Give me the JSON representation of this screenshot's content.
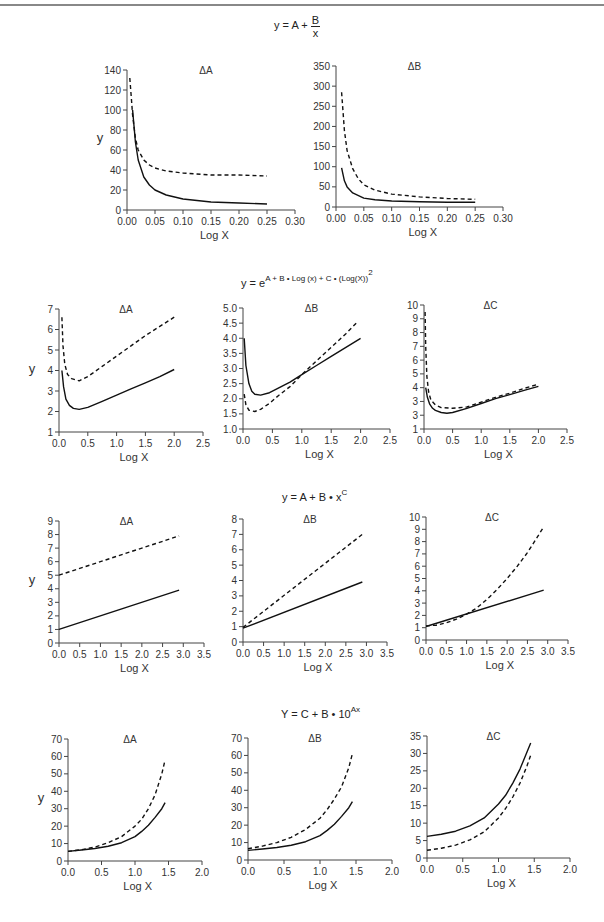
{
  "page": {
    "header_text": ""
  },
  "sections": [
    {
      "formula_text": "y = A + B/x",
      "formula_main": "y = A + ",
      "formula_num": "B",
      "formula_den": "x"
    },
    {
      "formula_text": "y = e^(A + B·Log (x) + C·(Log(X))^2)",
      "formula_main": "y = e",
      "formula_sup": "A + B • Log (x) + C • (Log(X))",
      "formula_sup2": "2"
    },
    {
      "formula_text": "y = A + B · x^C",
      "formula_main": "y = A + B • x",
      "formula_sup": "C"
    },
    {
      "formula_text": "Y = C + B · 10^Ax",
      "formula_main": "Y = C + B • 10",
      "formula_sup": "Ax"
    }
  ],
  "chart_data": [
    {
      "type": "line",
      "section": 0,
      "title": "ΔA",
      "xlabel": "Log X",
      "ylabel": "y",
      "xlim": [
        0,
        0.3
      ],
      "ylim": [
        0,
        140
      ],
      "xticks": [
        "0.00",
        "0.05",
        "0.10",
        "0.15",
        "0.20",
        "0.25",
        "0.30"
      ],
      "yticks": [
        "0",
        "20",
        "40",
        "60",
        "80",
        "100",
        "120",
        "140"
      ],
      "box": {
        "x0": 127,
        "x1": 295,
        "ytop": 70,
        "ybot": 210
      },
      "series": [
        {
          "name": "solid",
          "style": "solid",
          "x": [
            0.01,
            0.015,
            0.02,
            0.03,
            0.04,
            0.05,
            0.07,
            0.1,
            0.15,
            0.2,
            0.25
          ],
          "y": [
            100,
            68,
            50,
            33,
            25,
            20,
            15,
            11,
            8,
            7,
            6
          ]
        },
        {
          "name": "dashed",
          "style": "dashed",
          "x": [
            0.005,
            0.008,
            0.01,
            0.015,
            0.02,
            0.03,
            0.04,
            0.05,
            0.07,
            0.1,
            0.15,
            0.2,
            0.25
          ],
          "y": [
            132,
            110,
            95,
            72,
            60,
            50,
            45,
            42,
            39,
            37,
            35,
            35,
            34
          ]
        }
      ]
    },
    {
      "type": "line",
      "section": 0,
      "title": "ΔB",
      "xlabel": "Log X",
      "ylabel": "",
      "xlim": [
        0,
        0.3
      ],
      "ylim": [
        0,
        350
      ],
      "xticks": [
        "0.00",
        "0.05",
        "0.10",
        "0.15",
        "0.20",
        "0.25",
        "0.30"
      ],
      "yticks": [
        "0",
        "50",
        "100",
        "150",
        "200",
        "250",
        "300",
        "350"
      ],
      "box": {
        "x0": 336,
        "x1": 503,
        "ytop": 66,
        "ybot": 207
      },
      "series": [
        {
          "name": "solid",
          "style": "solid",
          "x": [
            0.01,
            0.015,
            0.02,
            0.03,
            0.05,
            0.07,
            0.1,
            0.15,
            0.2,
            0.25
          ],
          "y": [
            97,
            65,
            50,
            35,
            22,
            18,
            15,
            13,
            12,
            12
          ]
        },
        {
          "name": "dashed",
          "style": "dashed",
          "x": [
            0.01,
            0.015,
            0.02,
            0.03,
            0.04,
            0.05,
            0.07,
            0.1,
            0.15,
            0.2,
            0.25
          ],
          "y": [
            285,
            190,
            140,
            95,
            70,
            55,
            42,
            32,
            25,
            21,
            19
          ]
        }
      ]
    },
    {
      "type": "line",
      "section": 1,
      "title": "ΔA",
      "xlabel": "Log X",
      "ylabel": "y",
      "xlim": [
        0,
        2.5
      ],
      "ylim": [
        1,
        7
      ],
      "xticks": [
        "0.0",
        "0.5",
        "1.0",
        "1.5",
        "2.0",
        "2.5"
      ],
      "yticks": [
        "1",
        "2",
        "3",
        "4",
        "5",
        "6",
        "7"
      ],
      "box": {
        "x0": 59,
        "x1": 203,
        "ytop": 309,
        "ybot": 432
      },
      "series": [
        {
          "name": "solid",
          "style": "solid",
          "x": [
            0.05,
            0.08,
            0.12,
            0.18,
            0.25,
            0.35,
            0.5,
            0.75,
            1.0,
            1.25,
            1.5,
            1.75,
            2.0
          ],
          "y": [
            4.0,
            3.2,
            2.6,
            2.3,
            2.15,
            2.1,
            2.2,
            2.5,
            2.8,
            3.1,
            3.4,
            3.7,
            4.05
          ]
        },
        {
          "name": "dashed",
          "style": "dashed",
          "x": [
            0.05,
            0.07,
            0.1,
            0.15,
            0.22,
            0.35,
            0.5,
            0.75,
            1.0,
            1.25,
            1.5,
            1.75,
            2.0
          ],
          "y": [
            6.6,
            5.2,
            4.3,
            3.8,
            3.6,
            3.5,
            3.7,
            4.2,
            4.7,
            5.2,
            5.7,
            6.15,
            6.6
          ]
        }
      ]
    },
    {
      "type": "line",
      "section": 1,
      "title": "ΔB",
      "xlabel": "Log X",
      "ylabel": "",
      "xlim": [
        0,
        2.5
      ],
      "ylim": [
        1.0,
        5.0
      ],
      "xticks": [
        "0.0",
        "0.5",
        "1.0",
        "1.5",
        "2.0",
        "2.5"
      ],
      "yticks": [
        "1.0",
        "1.5",
        "2.0",
        "2.5",
        "3.0",
        "3.5",
        "4.0",
        "4.5",
        "5.0"
      ],
      "box": {
        "x0": 243,
        "x1": 390,
        "ytop": 308,
        "ybot": 429
      },
      "series": [
        {
          "name": "solid",
          "style": "solid",
          "x": [
            0.02,
            0.05,
            0.1,
            0.15,
            0.2,
            0.3,
            0.45,
            0.6,
            0.8,
            1.0,
            1.25,
            1.5,
            1.75,
            2.0
          ],
          "y": [
            4.0,
            3.1,
            2.5,
            2.25,
            2.15,
            2.12,
            2.2,
            2.35,
            2.55,
            2.8,
            3.1,
            3.4,
            3.7,
            4.0
          ]
        },
        {
          "name": "dashed",
          "style": "dashed",
          "x": [
            0.02,
            0.05,
            0.1,
            0.2,
            0.3,
            0.45,
            0.6,
            0.8,
            1.0,
            1.25,
            1.5,
            1.75,
            1.95
          ],
          "y": [
            2.15,
            1.8,
            1.62,
            1.58,
            1.65,
            1.85,
            2.1,
            2.4,
            2.8,
            3.25,
            3.7,
            4.15,
            4.55
          ]
        }
      ]
    },
    {
      "type": "line",
      "section": 1,
      "title": "ΔC",
      "xlabel": "Log X",
      "ylabel": "",
      "xlim": [
        0,
        2.5
      ],
      "ylim": [
        1,
        10
      ],
      "xticks": [
        "0.0",
        "0.5",
        "1.0",
        "1.5",
        "2.0",
        "2.5"
      ],
      "yticks": [
        "1",
        "3",
        "3",
        "4",
        "5",
        "6",
        "7",
        "8",
        "9",
        "10"
      ],
      "box": {
        "x0": 424,
        "x1": 567,
        "ytop": 305,
        "ybot": 429
      },
      "series": [
        {
          "name": "solid",
          "style": "solid",
          "x": [
            0.03,
            0.06,
            0.1,
            0.15,
            0.2,
            0.3,
            0.4,
            0.5,
            0.75,
            1.0,
            1.25,
            1.5,
            1.75,
            2.0
          ],
          "y": [
            4.0,
            3.3,
            2.8,
            2.5,
            2.35,
            2.2,
            2.15,
            2.2,
            2.5,
            2.85,
            3.2,
            3.5,
            3.8,
            4.1
          ]
        },
        {
          "name": "dashed",
          "style": "dashed",
          "x": [
            0.02,
            0.03,
            0.05,
            0.08,
            0.12,
            0.2,
            0.3,
            0.5,
            0.75,
            1.0,
            1.25,
            1.5,
            1.75,
            2.0
          ],
          "y": [
            9.5,
            7.0,
            4.8,
            3.7,
            3.1,
            2.75,
            2.55,
            2.5,
            2.6,
            2.95,
            3.3,
            3.6,
            3.95,
            4.25
          ]
        }
      ]
    },
    {
      "type": "line",
      "section": 2,
      "title": "ΔA",
      "xlabel": "Log X",
      "ylabel": "y",
      "xlim": [
        0,
        3.5
      ],
      "ylim": [
        0,
        9
      ],
      "xticks": [
        "0.0",
        "0.5",
        "1.0",
        "1.5",
        "2.0",
        "2.5",
        "3.0",
        "3.5"
      ],
      "yticks": [
        "0",
        "1",
        "2",
        "3",
        "4",
        "5",
        "6",
        "7",
        "8",
        "9"
      ],
      "box": {
        "x0": 59,
        "x1": 204,
        "ytop": 521,
        "ybot": 643
      },
      "series": [
        {
          "name": "solid",
          "style": "solid",
          "x": [
            0.0,
            2.9
          ],
          "y": [
            1.0,
            3.9
          ]
        },
        {
          "name": "dashed",
          "style": "dashed",
          "x": [
            0.0,
            2.9
          ],
          "y": [
            5.0,
            7.9
          ]
        }
      ]
    },
    {
      "type": "line",
      "section": 2,
      "title": "ΔB",
      "xlabel": "Log X",
      "ylabel": "",
      "xlim": [
        0,
        3.5
      ],
      "ylim": [
        0,
        8
      ],
      "xticks": [
        "0.0",
        "0.5",
        "1.0",
        "1.5",
        "2.0",
        "2.5",
        "3.0",
        "3.5"
      ],
      "yticks": [
        "0",
        "1",
        "2",
        "3",
        "4",
        "5",
        "6",
        "7",
        "8"
      ],
      "box": {
        "x0": 243,
        "x1": 387,
        "ytop": 519,
        "ybot": 642
      },
      "series": [
        {
          "name": "solid",
          "style": "solid",
          "x": [
            0.0,
            2.9
          ],
          "y": [
            0.9,
            3.9
          ]
        },
        {
          "name": "dashed",
          "style": "dashed",
          "x": [
            0.0,
            2.9
          ],
          "y": [
            0.95,
            7.0
          ]
        }
      ]
    },
    {
      "type": "line",
      "section": 2,
      "title": "ΔC",
      "xlabel": "Log X",
      "ylabel": "",
      "xlim": [
        0,
        3.5
      ],
      "ylim": [
        0,
        10
      ],
      "xticks": [
        "0.0",
        "0.5",
        "1.0",
        "1.5",
        "2.0",
        "2.5",
        "3.0",
        "3.5"
      ],
      "yticks": [
        "0",
        "1",
        "2",
        "3",
        "4",
        "5",
        "6",
        "7",
        "8",
        "9",
        "10"
      ],
      "box": {
        "x0": 426,
        "x1": 568,
        "ytop": 517,
        "ybot": 640
      },
      "series": [
        {
          "name": "solid",
          "style": "solid",
          "x": [
            0.0,
            2.9
          ],
          "y": [
            1.1,
            4.05
          ]
        },
        {
          "name": "dashed",
          "style": "dashed",
          "x": [
            0.0,
            0.25,
            0.5,
            0.75,
            1.0,
            1.25,
            1.5,
            1.75,
            2.0,
            2.25,
            2.5,
            2.75,
            2.9
          ],
          "y": [
            1.15,
            1.2,
            1.4,
            1.7,
            2.1,
            2.6,
            3.3,
            4.1,
            5.0,
            6.0,
            7.1,
            8.4,
            9.2
          ]
        }
      ]
    },
    {
      "type": "line",
      "section": 3,
      "title": "ΔA",
      "xlabel": "Log X",
      "ylabel": "y",
      "xlim": [
        0,
        2.0
      ],
      "ylim": [
        0,
        70
      ],
      "xticks": [
        "0.0",
        "0.5",
        "1.0",
        "1.5",
        "2.0"
      ],
      "yticks": [
        "0",
        "10",
        "20",
        "30",
        "40",
        "50",
        "60",
        "70"
      ],
      "box": {
        "x0": 68,
        "x1": 202,
        "ytop": 739,
        "ybot": 861
      },
      "series": [
        {
          "name": "solid",
          "style": "solid",
          "x": [
            0.0,
            0.2,
            0.4,
            0.6,
            0.8,
            1.0,
            1.1,
            1.2,
            1.3,
            1.4,
            1.45
          ],
          "y": [
            5.5,
            6.3,
            7.2,
            8.5,
            10.5,
            14,
            17,
            20.5,
            25,
            30,
            33.5
          ]
        },
        {
          "name": "dashed",
          "style": "dashed",
          "x": [
            0.0,
            0.2,
            0.4,
            0.6,
            0.8,
            1.0,
            1.1,
            1.2,
            1.3,
            1.4,
            1.45
          ],
          "y": [
            5.5,
            6.5,
            8,
            10.5,
            14,
            20,
            24,
            30,
            38,
            50,
            58
          ]
        }
      ]
    },
    {
      "type": "line",
      "section": 3,
      "title": "ΔB",
      "xlabel": "Log X",
      "ylabel": "",
      "xlim": [
        0,
        2.0
      ],
      "ylim": [
        0,
        70
      ],
      "xticks": [
        "0.0",
        "0.5",
        "1.0",
        "1.5",
        "2.0"
      ],
      "yticks": [
        "0",
        "10",
        "20",
        "30",
        "40",
        "50",
        "60",
        "70"
      ],
      "box": {
        "x0": 248,
        "x1": 392,
        "ytop": 738,
        "ybot": 860
      },
      "series": [
        {
          "name": "solid",
          "style": "solid",
          "x": [
            0.0,
            0.2,
            0.4,
            0.6,
            0.8,
            1.0,
            1.1,
            1.2,
            1.3,
            1.4,
            1.45
          ],
          "y": [
            5.5,
            6.3,
            7.2,
            8.5,
            10.5,
            14,
            17,
            20.5,
            25,
            30,
            33.5
          ]
        },
        {
          "name": "dashed",
          "style": "dashed",
          "x": [
            0.0,
            0.2,
            0.4,
            0.6,
            0.8,
            1.0,
            1.1,
            1.2,
            1.3,
            1.4,
            1.45
          ],
          "y": [
            6.5,
            8,
            10,
            13,
            17.5,
            24,
            29,
            35,
            42,
            53,
            61
          ]
        }
      ]
    },
    {
      "type": "line",
      "section": 3,
      "title": "ΔC",
      "xlabel": "Log X",
      "ylabel": "",
      "xlim": [
        0,
        2.0
      ],
      "ylim": [
        0,
        35
      ],
      "xticks": [
        "0.0",
        "0.5",
        "1.0",
        "1.5",
        "2.0"
      ],
      "yticks": [
        "0",
        "5",
        "10",
        "15",
        "20",
        "25",
        "30",
        "35"
      ],
      "box": {
        "x0": 427,
        "x1": 570,
        "ytop": 736,
        "ybot": 858
      },
      "series": [
        {
          "name": "solid",
          "style": "solid",
          "x": [
            0.0,
            0.2,
            0.4,
            0.6,
            0.8,
            1.0,
            1.1,
            1.2,
            1.3,
            1.4,
            1.45
          ],
          "y": [
            6.2,
            6.8,
            7.7,
            9.2,
            11.5,
            15.5,
            18,
            21.5,
            25.5,
            30.5,
            33
          ]
        },
        {
          "name": "dashed",
          "style": "dashed",
          "x": [
            0.0,
            0.2,
            0.4,
            0.6,
            0.8,
            1.0,
            1.1,
            1.2,
            1.3,
            1.4,
            1.45
          ],
          "y": [
            2.2,
            2.8,
            3.7,
            5.2,
            7.5,
            11.5,
            14.2,
            17.5,
            21.5,
            26.5,
            29.5
          ]
        }
      ]
    }
  ]
}
